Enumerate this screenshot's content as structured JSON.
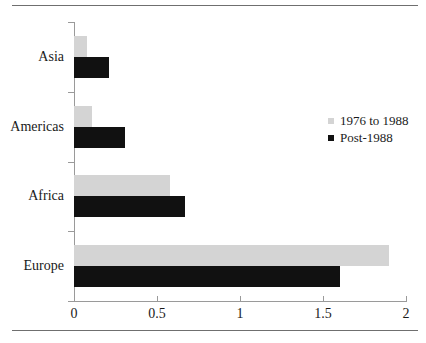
{
  "chart_data": {
    "type": "bar",
    "orientation": "horizontal",
    "title": "",
    "xlabel": "",
    "ylabel": "",
    "categories": [
      "Asia",
      "Americas",
      "Africa",
      "Europe"
    ],
    "series": [
      {
        "name": "1976 to 1988",
        "color": "#d4d4d4",
        "values": [
          0.08,
          0.11,
          0.58,
          1.9
        ]
      },
      {
        "name": "Post-1988",
        "color": "#111111",
        "values": [
          0.21,
          0.31,
          0.67,
          1.6
        ]
      }
    ],
    "xlim": [
      0,
      2
    ],
    "xticks": [
      0,
      0.5,
      1,
      1.5,
      2
    ],
    "xtick_labels": [
      "0",
      "0.5",
      "1",
      "1.5",
      "2"
    ],
    "grid": false,
    "legend_position": "center-right"
  },
  "legend": {
    "items": [
      {
        "label": "1976 to 1988",
        "marker": "square-marker-light"
      },
      {
        "label": "Post-1988",
        "marker": "square-marker-dark"
      }
    ]
  }
}
